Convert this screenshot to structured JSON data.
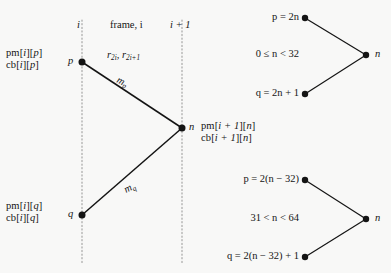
{
  "figure": {
    "colors": {
      "background": "#f8f8f7",
      "stroke": "#141414",
      "dotted_guide": "#9a9a9a",
      "text": "#141414"
    }
  },
  "frame_panel": {
    "column_headers": [
      {
        "id": "left-boundary",
        "text": "i"
      },
      {
        "id": "frame-caption",
        "text": "frame, i"
      },
      {
        "id": "right-boundary",
        "text": "i + 1"
      }
    ],
    "guides": [
      {
        "id": "guide-left",
        "x": 82
      },
      {
        "id": "guide-right",
        "x": 182
      }
    ],
    "nodes": [
      {
        "id": "node-p",
        "label": "p",
        "x": 82,
        "y": 62
      },
      {
        "id": "node-q",
        "label": "q",
        "x": 82,
        "y": 215
      },
      {
        "id": "node-n",
        "label": "n",
        "x": 182,
        "y": 128
      }
    ],
    "edges": [
      {
        "id": "edge-p-to-n",
        "label": "m",
        "sub": "p",
        "from": "node-p",
        "to": "node-n"
      },
      {
        "id": "edge-q-to-n",
        "label": "m",
        "sub": "q",
        "from": "node-q",
        "to": "node-n"
      }
    ],
    "frame_rate_label": {
      "base": "r",
      "sub1": "2i",
      "sep": ", ",
      "base2": "r",
      "sub2": "2i+1"
    },
    "array_labels": [
      {
        "id": "arrays-p",
        "lines": [
          {
            "name": "pm",
            "index1": "i",
            "index2": "p"
          },
          {
            "name": "cb",
            "index1": "i",
            "index2": "p"
          }
        ]
      },
      {
        "id": "arrays-q",
        "lines": [
          {
            "name": "pm",
            "index1": "i",
            "index2": "q"
          },
          {
            "name": "cb",
            "index1": "i",
            "index2": "q"
          }
        ]
      },
      {
        "id": "arrays-n",
        "lines": [
          {
            "name": "pm",
            "index1": "i + 1",
            "index2": "n"
          },
          {
            "name": "cb",
            "index1": "i + 1",
            "index2": "n"
          }
        ]
      }
    ]
  },
  "trees": [
    {
      "id": "tree-upper",
      "condition": "0 ≤ n < 32",
      "p_equation": "p = 2n",
      "q_equation": "q = 2n + 1",
      "root_label": "n",
      "nodes": [
        {
          "id": "upper-p-dot",
          "x": 305,
          "y": 18
        },
        {
          "id": "upper-q-dot",
          "x": 305,
          "y": 94
        },
        {
          "id": "upper-n-dot",
          "x": 366,
          "y": 55
        }
      ]
    },
    {
      "id": "tree-lower",
      "condition": "31 < n < 64",
      "p_equation": "p = 2(n − 32)",
      "q_equation": "q = 2(n − 32) + 1",
      "root_label": "n",
      "nodes": [
        {
          "id": "lower-p-dot",
          "x": 305,
          "y": 180
        },
        {
          "id": "lower-q-dot",
          "x": 305,
          "y": 257
        },
        {
          "id": "lower-n-dot",
          "x": 366,
          "y": 219
        }
      ]
    }
  ]
}
